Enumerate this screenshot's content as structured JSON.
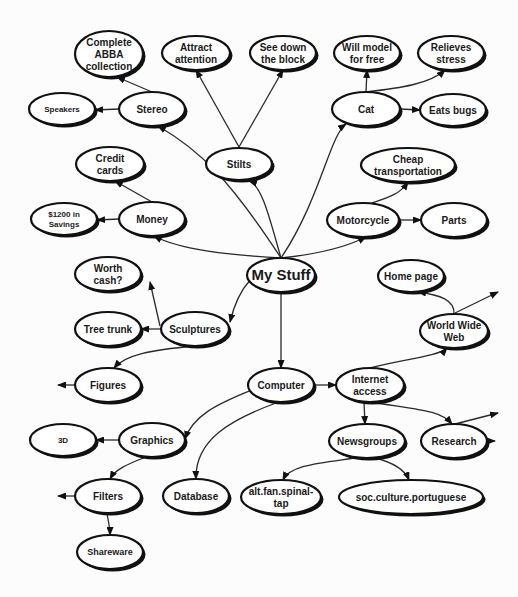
{
  "diagram": {
    "type": "mind-map",
    "root": "my_stuff",
    "nodes": [
      {
        "id": "my_stuff",
        "lines": [
          "My Stuff"
        ],
        "x": 281,
        "y": 275,
        "rx": 34,
        "ry": 17,
        "size": 15,
        "weight": "normal"
      },
      {
        "id": "stilts",
        "lines": [
          "Stilts"
        ],
        "x": 239,
        "y": 164,
        "rx": 33,
        "ry": 16,
        "size": 10
      },
      {
        "id": "attract",
        "lines": [
          "Attract",
          "attention"
        ],
        "x": 196,
        "y": 53,
        "rx": 34,
        "ry": 17,
        "size": 10
      },
      {
        "id": "seedown",
        "lines": [
          "See down",
          "the block"
        ],
        "x": 283,
        "y": 53,
        "rx": 33,
        "ry": 17,
        "size": 10
      },
      {
        "id": "stereo",
        "lines": [
          "Stereo"
        ],
        "x": 152,
        "y": 109,
        "rx": 33,
        "ry": 17,
        "size": 10
      },
      {
        "id": "abba",
        "lines": [
          "Complete",
          "ABBA",
          "collection"
        ],
        "x": 109,
        "y": 54,
        "rx": 34,
        "ry": 23,
        "size": 10
      },
      {
        "id": "speakers",
        "lines": [
          "Speakers"
        ],
        "x": 62,
        "y": 109,
        "rx": 33,
        "ry": 16,
        "size": 8
      },
      {
        "id": "money",
        "lines": [
          "Money"
        ],
        "x": 152,
        "y": 219,
        "rx": 33,
        "ry": 17,
        "size": 10
      },
      {
        "id": "credit",
        "lines": [
          "Credit",
          "cards"
        ],
        "x": 110,
        "y": 164,
        "rx": 34,
        "ry": 17,
        "size": 10
      },
      {
        "id": "savings",
        "lines": [
          "$1200 in",
          "Savings"
        ],
        "x": 64,
        "y": 219,
        "rx": 33,
        "ry": 16,
        "size": 8
      },
      {
        "id": "cat",
        "lines": [
          "Cat"
        ],
        "x": 366,
        "y": 109,
        "rx": 34,
        "ry": 17,
        "size": 10
      },
      {
        "id": "willmodel",
        "lines": [
          "Will model",
          "for  free"
        ],
        "x": 367,
        "y": 53,
        "rx": 33,
        "ry": 17,
        "size": 10
      },
      {
        "id": "relieves",
        "lines": [
          "Relieves",
          "stress"
        ],
        "x": 451,
        "y": 53,
        "rx": 33,
        "ry": 17,
        "size": 10
      },
      {
        "id": "eatsbugs",
        "lines": [
          "Eats bugs"
        ],
        "x": 453,
        "y": 110,
        "rx": 33,
        "ry": 16,
        "size": 10
      },
      {
        "id": "motorcycle",
        "lines": [
          "Motorcycle"
        ],
        "x": 363,
        "y": 220,
        "rx": 36,
        "ry": 17,
        "size": 10
      },
      {
        "id": "cheap",
        "lines": [
          "Cheap",
          "transportation"
        ],
        "x": 408,
        "y": 165,
        "rx": 47,
        "ry": 17,
        "size": 10
      },
      {
        "id": "parts",
        "lines": [
          "Parts"
        ],
        "x": 454,
        "y": 220,
        "rx": 33,
        "ry": 17,
        "size": 10
      },
      {
        "id": "sculptures",
        "lines": [
          "Sculptures"
        ],
        "x": 195,
        "y": 329,
        "rx": 34,
        "ry": 17,
        "size": 10
      },
      {
        "id": "worth",
        "lines": [
          "Worth",
          "cash?"
        ],
        "x": 108,
        "y": 274,
        "rx": 33,
        "ry": 17,
        "size": 10
      },
      {
        "id": "treetrunk",
        "lines": [
          "Tree trunk"
        ],
        "x": 108,
        "y": 329,
        "rx": 33,
        "ry": 17,
        "size": 10
      },
      {
        "id": "figures",
        "lines": [
          "Figures"
        ],
        "x": 108,
        "y": 385,
        "rx": 33,
        "ry": 17,
        "size": 10
      },
      {
        "id": "computer",
        "lines": [
          "Computer"
        ],
        "x": 281,
        "y": 385,
        "rx": 33,
        "ry": 17,
        "size": 10
      },
      {
        "id": "internet",
        "lines": [
          "Internet",
          "access"
        ],
        "x": 370,
        "y": 385,
        "rx": 34,
        "ry": 17,
        "size": 10
      },
      {
        "id": "homepage",
        "lines": [
          "Home page"
        ],
        "x": 411,
        "y": 276,
        "rx": 33,
        "ry": 16,
        "size": 10
      },
      {
        "id": "www",
        "lines": [
          "World Wide",
          "Web"
        ],
        "x": 454,
        "y": 331,
        "rx": 34,
        "ry": 17,
        "size": 10
      },
      {
        "id": "newsgroups",
        "lines": [
          "Newsgroups"
        ],
        "x": 367,
        "y": 441,
        "rx": 38,
        "ry": 17,
        "size": 10
      },
      {
        "id": "research",
        "lines": [
          "Research"
        ],
        "x": 454,
        "y": 441,
        "rx": 33,
        "ry": 17,
        "size": 10
      },
      {
        "id": "graphics",
        "lines": [
          "Graphics"
        ],
        "x": 152,
        "y": 440,
        "rx": 33,
        "ry": 17,
        "size": 10
      },
      {
        "id": "threed",
        "lines": [
          "3D"
        ],
        "x": 63,
        "y": 440,
        "rx": 33,
        "ry": 16,
        "size": 8
      },
      {
        "id": "filters",
        "lines": [
          "Filters"
        ],
        "x": 108,
        "y": 496,
        "rx": 33,
        "ry": 17,
        "size": 10
      },
      {
        "id": "shareware",
        "lines": [
          "Shareware"
        ],
        "x": 110,
        "y": 552,
        "rx": 33,
        "ry": 17,
        "size": 9
      },
      {
        "id": "database",
        "lines": [
          "Database"
        ],
        "x": 196,
        "y": 496,
        "rx": 33,
        "ry": 17,
        "size": 10
      },
      {
        "id": "spinaltap",
        "lines": [
          "alt.fan.spinal-",
          "tap"
        ],
        "x": 281,
        "y": 497,
        "rx": 40,
        "ry": 17,
        "size": 10
      },
      {
        "id": "portuguese",
        "lines": [
          "soc.culture.portuguese"
        ],
        "x": 411,
        "y": 497,
        "rx": 72,
        "ry": 17,
        "size": 10
      }
    ],
    "edges": [
      {
        "from": [
          281,
          258
        ],
        "c1": [
          270,
          220
        ],
        "c2": [
          262,
          185
        ],
        "to": [
          249,
          181
        ]
      },
      {
        "from": [
          239,
          147
        ],
        "to": [
          196,
          70
        ]
      },
      {
        "from": [
          239,
          147
        ],
        "to": [
          283,
          70
        ]
      },
      {
        "from": [
          281,
          258
        ],
        "c1": [
          230,
          180
        ],
        "c2": [
          200,
          150
        ],
        "to": [
          158,
          126
        ]
      },
      {
        "from": [
          152,
          92
        ],
        "to": [
          117,
          77
        ]
      },
      {
        "from": [
          119,
          109
        ],
        "to": [
          95,
          110
        ]
      },
      {
        "from": [
          281,
          258
        ],
        "c1": [
          230,
          255
        ],
        "c2": [
          180,
          250
        ],
        "to": [
          154,
          236
        ]
      },
      {
        "from": [
          152,
          202
        ],
        "to": [
          115,
          181
        ]
      },
      {
        "from": [
          119,
          219
        ],
        "to": [
          97,
          220
        ]
      },
      {
        "from": [
          281,
          258
        ],
        "c1": [
          320,
          200
        ],
        "c2": [
          330,
          135
        ],
        "to": [
          346,
          124
        ]
      },
      {
        "from": [
          366,
          92
        ],
        "to": [
          367,
          70
        ]
      },
      {
        "from": [
          366,
          92
        ],
        "c1": [
          400,
          88
        ],
        "c2": [
          430,
          84
        ],
        "to": [
          445,
          70
        ]
      },
      {
        "from": [
          400,
          109
        ],
        "to": [
          420,
          110
        ]
      },
      {
        "from": [
          281,
          258
        ],
        "c1": [
          310,
          255
        ],
        "c2": [
          340,
          250
        ],
        "to": [
          366,
          237
        ]
      },
      {
        "from": [
          372,
          203
        ],
        "c1": [
          390,
          197
        ],
        "c2": [
          400,
          194
        ],
        "to": [
          408,
          182
        ]
      },
      {
        "from": [
          399,
          220
        ],
        "to": [
          421,
          220
        ]
      },
      {
        "from": [
          281,
          258
        ],
        "c1": [
          260,
          270
        ],
        "c2": [
          240,
          280
        ],
        "to": [
          230,
          322
        ]
      },
      {
        "from": [
          162,
          329
        ],
        "to": [
          141,
          329
        ]
      },
      {
        "from": [
          160,
          326
        ],
        "to": [
          150,
          282
        ]
      },
      {
        "from": [
          195,
          346
        ],
        "c1": [
          150,
          350
        ],
        "c2": [
          125,
          355
        ],
        "to": [
          114,
          368
        ]
      },
      {
        "from": [
          75,
          385
        ],
        "to": [
          58,
          385
        ]
      },
      {
        "from": [
          281,
          292
        ],
        "to": [
          281,
          368
        ]
      },
      {
        "from": [
          314,
          385
        ],
        "to": [
          336,
          385
        ]
      },
      {
        "from": [
          370,
          368
        ],
        "c1": [
          400,
          360
        ],
        "c2": [
          440,
          356
        ],
        "to": [
          447,
          348
        ]
      },
      {
        "from": [
          454,
          314
        ],
        "c1": [
          455,
          300
        ],
        "c2": [
          440,
          295
        ],
        "to": [
          418,
          292
        ]
      },
      {
        "from": [
          455,
          313
        ],
        "to": [
          498,
          292
        ]
      },
      {
        "from": [
          364,
          402
        ],
        "to": [
          365,
          424
        ]
      },
      {
        "from": [
          370,
          402
        ],
        "c1": [
          420,
          410
        ],
        "c2": [
          440,
          410
        ],
        "to": [
          452,
          424
        ]
      },
      {
        "from": [
          455,
          424
        ],
        "to": [
          498,
          413
        ]
      },
      {
        "from": [
          487,
          441
        ],
        "to": [
          495,
          441
        ]
      },
      {
        "from": [
          258,
          387
        ],
        "c1": [
          230,
          400
        ],
        "c2": [
          195,
          410
        ],
        "to": [
          185,
          439
        ]
      },
      {
        "from": [
          276,
          403
        ],
        "c1": [
          230,
          420
        ],
        "c2": [
          195,
          440
        ],
        "to": [
          196,
          479
        ]
      },
      {
        "from": [
          119,
          440
        ],
        "to": [
          96,
          440
        ]
      },
      {
        "from": [
          146,
          457
        ],
        "c1": [
          125,
          465
        ],
        "c2": [
          115,
          470
        ],
        "to": [
          110,
          479
        ]
      },
      {
        "from": [
          75,
          496
        ],
        "to": [
          58,
          496
        ]
      },
      {
        "from": [
          107,
          513
        ],
        "c1": [
          108,
          520
        ],
        "c2": [
          110,
          528
        ],
        "to": [
          110,
          535
        ]
      },
      {
        "from": [
          355,
          458
        ],
        "c1": [
          320,
          463
        ],
        "c2": [
          290,
          465
        ],
        "to": [
          283,
          480
        ]
      },
      {
        "from": [
          375,
          458
        ],
        "c1": [
          395,
          463
        ],
        "c2": [
          405,
          470
        ],
        "to": [
          409,
          480
        ]
      }
    ]
  }
}
